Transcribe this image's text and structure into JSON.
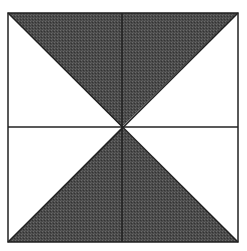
{
  "diagram": {
    "colors": {
      "background": "#ffffff",
      "shade": "#4a4a4a",
      "line": "#222222"
    },
    "regions": [
      {
        "name": "top-triangle",
        "shaded": true
      },
      {
        "name": "bottom-triangle",
        "shaded": true
      },
      {
        "name": "left-upper-triangle",
        "shaded": false
      },
      {
        "name": "left-lower-triangle",
        "shaded": false
      },
      {
        "name": "right-upper-triangle",
        "shaded": false
      },
      {
        "name": "right-lower-triangle",
        "shaded": false
      }
    ]
  }
}
